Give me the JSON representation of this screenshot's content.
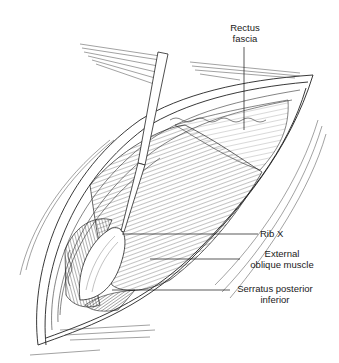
{
  "figure": {
    "type": "anatomical line illustration",
    "ink_color": "#1a1a1a",
    "background": "#ffffff"
  },
  "labels": [
    {
      "id": "rectus_fascia",
      "line1": "Rectus",
      "line2": "fascia"
    },
    {
      "id": "rib_x",
      "line1": "Rib X",
      "line2": ""
    },
    {
      "id": "external_oblique",
      "line1": "External",
      "line2": "oblique muscle"
    },
    {
      "id": "serratus",
      "line1": "Serratus posterior",
      "line2": "inferior"
    }
  ]
}
